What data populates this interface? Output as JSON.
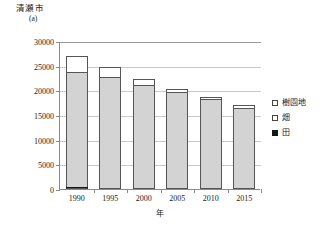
{
  "chart_data": {
    "type": "bar",
    "title": "清瀬市",
    "subtitle": "(a)",
    "unit_label": "(a)",
    "xlabel": "年",
    "ylabel": "",
    "categories": [
      "1990",
      "1995",
      "2000",
      "2005",
      "2010",
      "2015"
    ],
    "ylim": [
      0,
      30000
    ],
    "yticks": [
      0,
      5000,
      10000,
      15000,
      20000,
      25000,
      30000
    ],
    "ytick_labels": [
      "0",
      "5000",
      "10000",
      "15000",
      "20000",
      "25000",
      "30000"
    ],
    "grid": true,
    "stacked": true,
    "legend_position": "right",
    "stack_order_bottom_to_top": [
      "田",
      "畑",
      "樹園地"
    ],
    "series": [
      {
        "name": "田",
        "color": "#151515",
        "values": [
          400,
          0,
          0,
          0,
          0,
          0
        ]
      },
      {
        "name": "畑",
        "color": "#d3d3d3",
        "values": [
          23400,
          22800,
          21000,
          19700,
          18200,
          16500
        ]
      },
      {
        "name": "樹園地",
        "color": "#ffffff",
        "values": [
          3200,
          1900,
          1300,
          500,
          500,
          500
        ]
      }
    ],
    "totals": [
      27000,
      24700,
      22300,
      20200,
      18700,
      17000
    ]
  },
  "legend": {
    "items": [
      {
        "label": "樹園地",
        "swatch": "open-square-white"
      },
      {
        "label": "畑",
        "swatch": "open-square-white"
      },
      {
        "label": "田",
        "swatch": "filled-square-black"
      }
    ]
  }
}
